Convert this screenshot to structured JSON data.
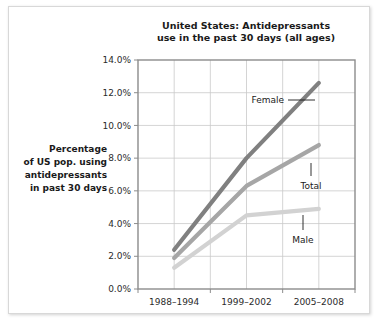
{
  "figure": {
    "background_color": "#ffffff",
    "border_color": "#d8d8d8"
  },
  "axis_caption": {
    "lines": [
      "Percentage",
      "of US pop. using",
      "antidepressants",
      "in past 30 days"
    ]
  },
  "chart_data": {
    "type": "line",
    "title": "United States: Antidepressants\nuse in the past 30 days (all ages)",
    "title_lines": [
      "United States: Antidepressants",
      "use in the past 30 days (all ages)"
    ],
    "xlabel": "",
    "ylabel": "Percentage of US pop. using antidepressants in past 30 days",
    "categories": [
      "1988–1994",
      "1999–2002",
      "2005–2008"
    ],
    "ylim": [
      0.0,
      14.0
    ],
    "ytick_values": [
      0.0,
      2.0,
      4.0,
      6.0,
      8.0,
      10.0,
      12.0,
      14.0
    ],
    "ytick_labels": [
      "0.0%",
      "2.0%",
      "4.0%",
      "6.0%",
      "8.0%",
      "10.0%",
      "12.0%",
      "14.0%"
    ],
    "grid": true,
    "legend": "annotations",
    "series": [
      {
        "name": "Female",
        "values": [
          2.4,
          8.0,
          12.6
        ],
        "color": "#808080",
        "label": "Female"
      },
      {
        "name": "Total",
        "values": [
          1.9,
          6.3,
          8.8
        ],
        "color": "#a6a6a6",
        "label": "Total"
      },
      {
        "name": "Male",
        "values": [
          1.3,
          4.5,
          4.9
        ],
        "color": "#d2d2d2",
        "label": "Male"
      }
    ],
    "annotations": [
      {
        "text": "Female",
        "series": "Female"
      },
      {
        "text": "Total",
        "series": "Total"
      },
      {
        "text": "Male",
        "series": "Male"
      }
    ]
  }
}
